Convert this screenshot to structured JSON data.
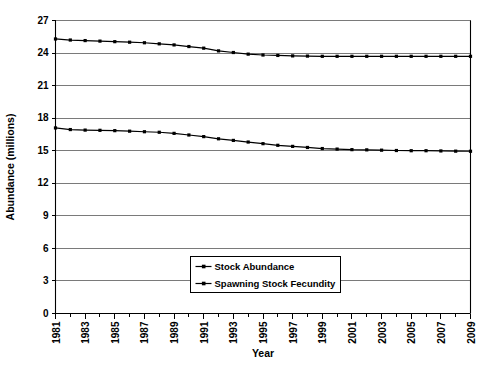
{
  "chart_data": {
    "type": "line",
    "title": "",
    "xlabel": "Year",
    "ylabel": "Abundance (millions)",
    "xlim": [
      1981,
      2009
    ],
    "ylim": [
      0,
      27
    ],
    "ytick_values": [
      0,
      3,
      6,
      9,
      12,
      15,
      18,
      21,
      24,
      27
    ],
    "ytick_labels": [
      "0",
      "3",
      "6",
      "9",
      "12",
      "15",
      "18",
      "21",
      "24",
      "27"
    ],
    "xtick_values": [
      1981,
      1983,
      1985,
      1987,
      1989,
      1991,
      1993,
      1995,
      1997,
      1999,
      2001,
      2003,
      2005,
      2007,
      2009
    ],
    "xtick_labels": [
      "1981",
      "1983",
      "1985",
      "1987",
      "1989",
      "1991",
      "1993",
      "1995",
      "1997",
      "1999",
      "2001",
      "2003",
      "2005",
      "2007",
      "2009"
    ],
    "x": [
      1981,
      1982,
      1983,
      1984,
      1985,
      1986,
      1987,
      1988,
      1989,
      1990,
      1991,
      1992,
      1993,
      1994,
      1995,
      1996,
      1997,
      1998,
      1999,
      2000,
      2001,
      2002,
      2003,
      2004,
      2005,
      2006,
      2007,
      2008,
      2009
    ],
    "grid": "horizontal",
    "legend_position": "lower-center",
    "marker": "square",
    "line_color": "#000000",
    "grid_color": "#7a7a7a",
    "series": [
      {
        "name": "Stock Abundance",
        "values": [
          25.3,
          25.2,
          25.15,
          25.1,
          25.05,
          25.0,
          24.95,
          24.85,
          24.75,
          24.6,
          24.45,
          24.2,
          24.05,
          23.9,
          23.82,
          23.78,
          23.74,
          23.72,
          23.7,
          23.7,
          23.7,
          23.7,
          23.7,
          23.7,
          23.7,
          23.7,
          23.7,
          23.7,
          23.7
        ]
      },
      {
        "name": "Spawning Stock Fecundity",
        "values": [
          17.1,
          16.95,
          16.9,
          16.88,
          16.85,
          16.8,
          16.75,
          16.7,
          16.6,
          16.45,
          16.3,
          16.1,
          15.95,
          15.8,
          15.65,
          15.5,
          15.4,
          15.3,
          15.2,
          15.15,
          15.1,
          15.08,
          15.05,
          15.02,
          15.0,
          15.0,
          14.98,
          14.96,
          14.95
        ]
      }
    ]
  }
}
